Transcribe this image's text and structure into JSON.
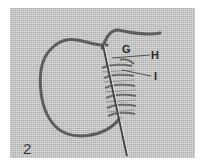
{
  "figure": {
    "number": "2",
    "labels": {
      "g": "G",
      "h": "H",
      "i": "I"
    },
    "colors": {
      "fabric": "#c9c9c9",
      "thread": "#5a5a5a",
      "needle": "#4a4a4a",
      "label": "#2a2a2a"
    }
  }
}
